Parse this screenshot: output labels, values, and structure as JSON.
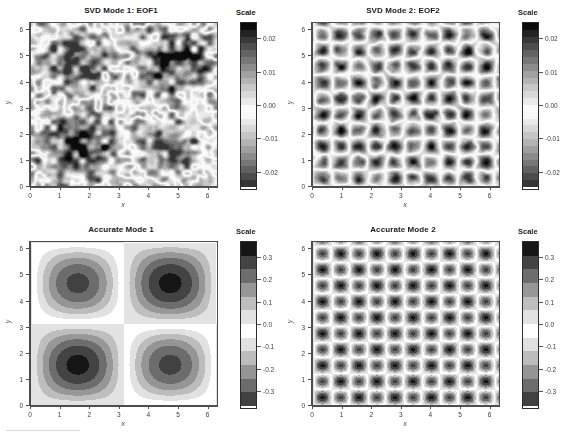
{
  "figure": {
    "width": 564,
    "height": 438,
    "background": "#ffffff",
    "layout": "2x2 grid of filled contour panels, each with a grayscale Scale colorbar"
  },
  "axis": {
    "xlabel": "x",
    "ylabel": "y",
    "xticks": [
      "0",
      "1",
      "2",
      "3",
      "4",
      "5",
      "6"
    ],
    "yticks": [
      "0",
      "1",
      "2",
      "3",
      "4",
      "5",
      "6"
    ],
    "xlim": [
      0,
      6.2832
    ],
    "ylim": [
      0,
      6.2832
    ]
  },
  "colorbar": {
    "title": "Scale"
  },
  "panels": [
    {
      "id": "svd-mode-1-eof1",
      "title": "SVD Mode 1: EOF1",
      "scale_labels": [
        "0.02",
        "0.01",
        "0.00",
        "-0.01",
        "-0.02"
      ],
      "scale_values": [
        0.02,
        0.01,
        0.0,
        -0.01,
        -0.02
      ]
    },
    {
      "id": "svd-mode-2-eof2",
      "title": "SVD Mode 2: EOF2",
      "scale_labels": [
        "0.02",
        "0.01",
        "0.00",
        "-0.01",
        "-0.02"
      ],
      "scale_values": [
        0.02,
        0.01,
        0.0,
        -0.01,
        -0.02
      ]
    },
    {
      "id": "accurate-mode-1",
      "title": "Accurate Mode 1",
      "scale_labels": [
        "0.3",
        "0.2",
        "0.1",
        "0.0",
        "-0.1",
        "-0.2",
        "-0.3"
      ],
      "scale_values": [
        0.3,
        0.2,
        0.1,
        0.0,
        -0.1,
        -0.2,
        -0.3
      ]
    },
    {
      "id": "accurate-mode-2",
      "title": "Accurate Mode 2",
      "scale_labels": [
        "0.3",
        "0.2",
        "0.1",
        "0.0",
        "-0.1",
        "-0.2",
        "-0.3"
      ],
      "scale_values": [
        0.3,
        0.2,
        0.1,
        0.0,
        -0.1,
        -0.2,
        -0.3
      ]
    }
  ],
  "chart_data": [
    {
      "type": "heatmap",
      "panel": "top-left",
      "title": "SVD Mode 1: EOF1",
      "xlabel": "x",
      "ylabel": "y",
      "colormap": "grayscale",
      "xlim": [
        0,
        6.2832
      ],
      "ylim": [
        0,
        6.2832
      ],
      "zlim": [
        -0.025,
        0.025
      ],
      "pattern": "noisy sin(x)sin(y) four-lobe pattern; dark lobes centered near (1.6,4.7), (4.7,4.7), (1.6,1.6), (4.7,1.6) with speckle noise",
      "colorbar_ticks": [
        0.02,
        0.01,
        0.0,
        -0.01,
        -0.02
      ],
      "n_levels": 24
    },
    {
      "type": "heatmap",
      "panel": "top-right",
      "title": "SVD Mode 2: EOF2",
      "xlabel": "x",
      "ylabel": "y",
      "colormap": "grayscale",
      "xlim": [
        0,
        6.2832
      ],
      "ylim": [
        0,
        6.2832
      ],
      "zlim": [
        -0.025,
        0.025
      ],
      "pattern": "high wavenumber checkerboard, sin(5x)sin(5y)-like, ~16x16 cells of dark dots with light surrounds",
      "colorbar_ticks": [
        0.02,
        0.01,
        0.0,
        -0.01,
        -0.02
      ],
      "n_levels": 24
    },
    {
      "type": "heatmap",
      "panel": "bottom-left",
      "title": "Accurate Mode 1",
      "xlabel": "x",
      "ylabel": "y",
      "colormap": "grayscale",
      "xlim": [
        0,
        6.2832
      ],
      "ylim": [
        0,
        6.2832
      ],
      "zlim": [
        -0.35,
        0.35
      ],
      "pattern": "smooth sin(x)sin(y) four-lobe pattern; black cores at (1.6,4.7) and (4.7,1.6); white separating bands along x=pi and y=pi",
      "colorbar_ticks": [
        0.3,
        0.2,
        0.1,
        0.0,
        -0.1,
        -0.2,
        -0.3
      ],
      "n_levels": 12
    },
    {
      "type": "heatmap",
      "panel": "bottom-right",
      "title": "Accurate Mode 2",
      "xlabel": "x",
      "ylabel": "y",
      "colormap": "grayscale",
      "xlim": [
        0,
        6.2832
      ],
      "ylim": [
        0,
        6.2832
      ],
      "zlim": [
        -0.35,
        0.35
      ],
      "pattern": "smooth high wavenumber checkerboard, sin(5x)sin(5y)-like, ~16x16 dark dot cells",
      "colorbar_ticks": [
        0.3,
        0.2,
        0.1,
        0.0,
        -0.1,
        -0.2,
        -0.3
      ],
      "n_levels": 12
    }
  ]
}
